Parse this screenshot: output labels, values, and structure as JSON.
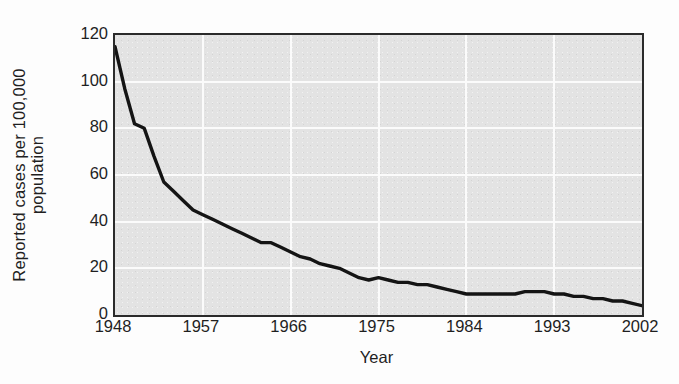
{
  "chart_data": {
    "type": "line",
    "title": "",
    "xlabel": "Year",
    "ylabel": "Reported cases per 100,000 population",
    "ylabel_line1": "Reported cases per 100,000",
    "ylabel_line2": "population",
    "xlim": [
      1948,
      2002
    ],
    "ylim": [
      0,
      120
    ],
    "grid": true,
    "legend": "none",
    "xticks": [
      "1948",
      "1957",
      "1966",
      "1975",
      "1984",
      "1993",
      "2002"
    ],
    "xtick_values": [
      1948,
      1957,
      1966,
      1975,
      1984,
      1993,
      2002
    ],
    "yticks": [
      "0",
      "20",
      "40",
      "60",
      "80",
      "100",
      "120"
    ],
    "ytick_values": [
      0,
      20,
      40,
      60,
      80,
      100,
      120
    ],
    "xgrid_values": [
      1957,
      1966,
      1975,
      1984,
      1993
    ],
    "ygrid_values": [
      20,
      40,
      60,
      80,
      100
    ],
    "series": [
      {
        "name": "Reported cases per 100,000 population",
        "color": "#141414",
        "line_width": 3.4,
        "x": [
          1948,
          1949,
          1950,
          1951,
          1952,
          1953,
          1954,
          1955,
          1956,
          1957,
          1958,
          1959,
          1960,
          1961,
          1962,
          1963,
          1964,
          1965,
          1966,
          1967,
          1968,
          1969,
          1970,
          1971,
          1972,
          1973,
          1974,
          1975,
          1976,
          1977,
          1978,
          1979,
          1980,
          1981,
          1982,
          1983,
          1984,
          1985,
          1986,
          1987,
          1988,
          1989,
          1990,
          1991,
          1992,
          1993,
          1994,
          1995,
          1996,
          1997,
          1998,
          1999,
          2000,
          2001,
          2002
        ],
        "y": [
          115,
          97,
          82,
          80,
          68,
          57,
          53,
          49,
          45,
          43,
          41,
          39,
          37,
          35,
          33,
          31,
          31,
          29,
          27,
          25,
          24,
          22,
          21,
          20,
          18,
          16,
          15,
          16,
          15,
          14,
          14,
          13,
          13,
          12,
          11,
          10,
          9,
          9,
          9,
          9,
          9,
          9,
          10,
          10,
          10,
          9,
          9,
          8,
          8,
          7,
          7,
          6,
          6,
          5,
          4
        ]
      }
    ]
  },
  "axes": {
    "plot_background_color": "#e3e3e3",
    "grid_color": "#fbfbfb",
    "frame_color": "#2b2b2b",
    "text_color": "#1f1f1f"
  }
}
